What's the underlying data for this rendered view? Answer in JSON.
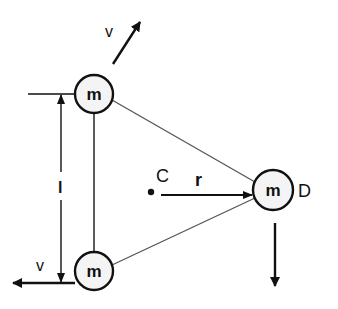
{
  "diagram": {
    "type": "physics-three-body-triangle",
    "masses": [
      {
        "id": "top",
        "label": "m",
        "cx": 94,
        "cy": 94,
        "r": 19
      },
      {
        "id": "bottom",
        "label": "m",
        "cx": 94,
        "cy": 271,
        "r": 19
      },
      {
        "id": "right",
        "label": "m",
        "cx": 273,
        "cy": 190,
        "r": 20,
        "point_label": "D"
      }
    ],
    "center": {
      "label": "C",
      "x": 151,
      "y": 192
    },
    "radius_label": "r",
    "side_length_label": "l",
    "velocity_labels": {
      "top": "v",
      "bottom": "v"
    },
    "colors": {
      "stroke": "#111111",
      "thin_line": "#444444",
      "mass_fill": "#f4f4f4"
    }
  }
}
